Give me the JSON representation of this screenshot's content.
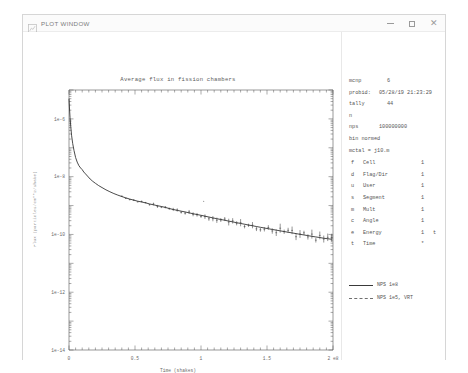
{
  "window": {
    "title": "PLOT WINDOW",
    "icon": "plot-window-icon",
    "minimize_label": "–",
    "maximize_label": "□",
    "close_label": "✕"
  },
  "info": {
    "code_key": "mcnp",
    "code_value": "6",
    "probid_key": "probid:",
    "probid_value": "05/28/19 21:23:29",
    "tally_key": "tally",
    "tally_value": "44",
    "particle": "n",
    "nps_key": "nps",
    "nps_value": "100000000",
    "bin_normed": "bin normed",
    "mctal": "mctal = j10.m"
  },
  "bins": {
    "rows": [
      {
        "code": "f",
        "name": "Cell",
        "num": "1",
        "flag": ""
      },
      {
        "code": "d",
        "name": "Flag/Dir",
        "num": "1",
        "flag": ""
      },
      {
        "code": "u",
        "name": "User",
        "num": "1",
        "flag": ""
      },
      {
        "code": "s",
        "name": "Segment",
        "num": "1",
        "flag": ""
      },
      {
        "code": "m",
        "name": "Mult",
        "num": "1",
        "flag": ""
      },
      {
        "code": "c",
        "name": "Angle",
        "num": "1",
        "flag": ""
      },
      {
        "code": "e",
        "name": "Energy",
        "num": "1",
        "flag": "t"
      },
      {
        "code": "t",
        "name": "Time",
        "num": "*",
        "flag": ""
      }
    ]
  },
  "legend": {
    "items": [
      {
        "label": "NPS 1e8",
        "style": "solid"
      },
      {
        "label": "NPS 1e5, VRT",
        "style": "dashed"
      }
    ]
  },
  "chart_data": {
    "type": "line",
    "title": "Average flux in fission chambers",
    "xlabel": "Time (shakes)",
    "ylabel": "Flux (particles/cm**2/shake)",
    "x_scale": "linear",
    "y_scale": "log",
    "xlim": [
      0,
      200000000.0
    ],
    "ylim": [
      1e-14,
      1e-05
    ],
    "x_tick_labels": [
      "0",
      "0.5",
      "1",
      "1.5",
      "2  e8"
    ],
    "x_tick_values": [
      0,
      50000000.0,
      100000000.0,
      150000000.0,
      200000000.0
    ],
    "y_tick_labels": [
      "1e-6",
      "1e-8",
      "1e-10",
      "1e-12",
      "1e-14"
    ],
    "y_tick_values": [
      1e-06,
      1e-08,
      1e-10,
      1e-12,
      1e-14
    ],
    "grid": false,
    "legend_position": "right",
    "axis_color": "#555555",
    "curve_color": "#2b2b2b",
    "series": [
      {
        "name": "NPS 1e8",
        "style": "solid",
        "comment": "x in units of 1e8 shakes; y is flux (log axis)",
        "x": [
          0.0,
          0.004,
          0.008,
          0.014,
          0.02,
          0.028,
          0.038,
          0.05,
          0.062,
          0.075,
          0.088,
          0.1,
          0.112,
          0.125,
          0.14,
          0.16,
          0.18,
          0.2,
          0.225,
          0.25,
          0.28,
          0.31,
          0.34,
          0.37,
          0.4,
          0.43,
          0.46,
          0.49,
          0.52,
          0.55,
          0.58,
          0.61,
          0.64,
          0.67,
          0.7,
          0.73,
          0.76,
          0.79,
          0.82,
          0.85,
          0.88,
          0.91,
          0.94,
          0.97,
          1.0,
          1.03,
          1.06,
          1.09,
          1.12,
          1.15,
          1.18,
          1.21,
          1.24,
          1.27,
          1.3,
          1.33,
          1.36,
          1.39,
          1.42,
          1.45,
          1.48,
          1.51,
          1.54,
          1.57,
          1.6,
          1.63,
          1.66,
          1.69,
          1.72,
          1.75,
          1.78,
          1.81,
          1.84,
          1.87,
          1.9,
          1.93,
          1.96,
          1.99
        ],
        "y": [
          5e-06,
          2.2e-06,
          1.1e-06,
          5e-07,
          2.6e-07,
          1.4e-07,
          8e-08,
          4.6e-08,
          3.2e-08,
          2.4e-08,
          2e-08,
          1.75e-08,
          1.45e-08,
          1.25e-08,
          1.05e-08,
          8.3e-09,
          6.9e-09,
          5.9e-09,
          4.9e-09,
          4.2e-09,
          3.5e-09,
          3e-09,
          2.6e-09,
          2.3e-09,
          2.05e-09,
          1.85e-09,
          1.68e-09,
          1.54e-09,
          1.42e-09,
          1.33e-09,
          1.24e-09,
          1.14e-09,
          1.06e-09,
          9.9e-10,
          9.3e-10,
          8.6e-10,
          7.9e-10,
          7.3e-10,
          6.8e-10,
          6.4e-10,
          6e-10,
          5.6e-10,
          5.2e-10,
          4.9e-10,
          4.6e-10,
          4.3e-10,
          4e-10,
          3.75e-10,
          3.5e-10,
          3.3e-10,
          3.1e-10,
          2.9e-10,
          2.72e-10,
          2.55e-10,
          2.4e-10,
          2.26e-10,
          2.12e-10,
          2e-10,
          1.88e-10,
          1.77e-10,
          1.67e-10,
          1.58e-10,
          1.49e-10,
          1.41e-10,
          1.33e-10,
          1.26e-10,
          1.19e-10,
          1.13e-10,
          1.07e-10,
          1.01e-10,
          9.6e-11,
          9.1e-11,
          8.6e-11,
          8.2e-11,
          7.8e-11,
          7.4e-11,
          7.1e-11,
          6.8e-11
        ]
      }
    ],
    "stray_point": {
      "x": 1.02,
      "y": 1.4e-09
    }
  }
}
